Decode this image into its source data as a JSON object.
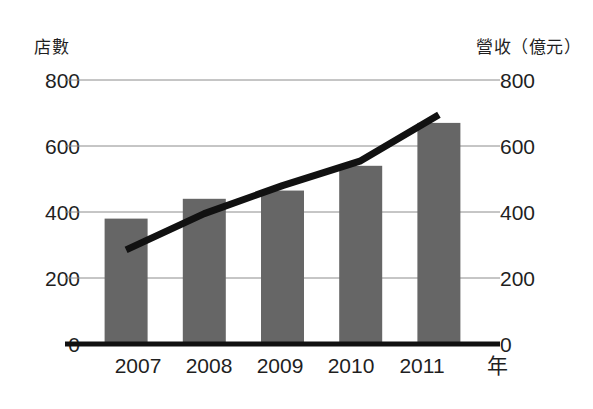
{
  "chart_data": {
    "type": "bar",
    "title": "",
    "subtitle": "",
    "xlabel": "年",
    "categories": [
      "2007",
      "2008",
      "2009",
      "2010",
      "2011"
    ],
    "grid": true,
    "legend": "none",
    "axes": {
      "left": {
        "label": "店數",
        "ticks": [
          "800",
          "600",
          "400",
          "200",
          "0"
        ],
        "tick_values": [
          800,
          600,
          400,
          200,
          0
        ],
        "ylim": [
          0,
          800
        ]
      },
      "right": {
        "label": "營收（億元）",
        "ticks": [
          "800",
          "600",
          "400",
          "200",
          "0"
        ],
        "tick_values": [
          800,
          600,
          400,
          200,
          0
        ],
        "ylim": [
          0,
          800
        ]
      }
    },
    "series": [
      {
        "name": "店數",
        "type": "bar",
        "axis": "left",
        "color": "#666666",
        "values": [
          380,
          440,
          465,
          540,
          670
        ]
      },
      {
        "name": "營收（億元）",
        "type": "line",
        "axis": "right",
        "color": "#111111",
        "values": [
          285,
          395,
          480,
          555,
          695
        ]
      }
    ]
  },
  "colors": {
    "bar": "#666666",
    "line": "#111111",
    "grid": "#8c8c8c",
    "axis": "#111111",
    "text": "#1f1f1f",
    "background": "#ffffff"
  }
}
